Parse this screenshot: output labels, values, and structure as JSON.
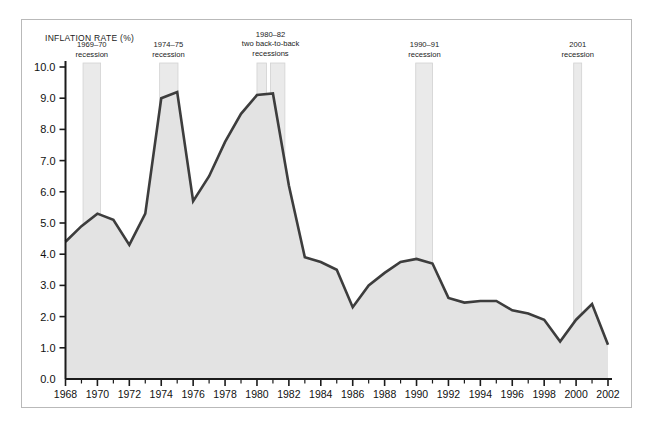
{
  "chart_data": {
    "type": "area",
    "title": "",
    "ylabel": "INFLATION RATE (%)",
    "xlabel": "",
    "xlim": [
      1968,
      2002
    ],
    "ylim": [
      0.0,
      10.0
    ],
    "grid": false,
    "legend": "none",
    "x_ticks": [
      1968,
      1970,
      1972,
      1974,
      1976,
      1978,
      1980,
      1982,
      1984,
      1986,
      1988,
      1990,
      1992,
      1994,
      1996,
      1998,
      2000,
      2002
    ],
    "x_tick_labels": [
      "1968",
      "1970",
      "1972",
      "1974",
      "1976",
      "1978",
      "1980",
      "1982",
      "1984",
      "1986",
      "1988",
      "1990",
      "1992",
      "1994",
      "1996",
      "1998",
      "2000",
      "2002"
    ],
    "x_minor_ticks": [
      1969,
      1971,
      1973,
      1975,
      1977,
      1979,
      1981,
      1983,
      1985,
      1987,
      1989,
      1991,
      1993,
      1995,
      1997,
      1999,
      2001
    ],
    "y_ticks": [
      0.0,
      1.0,
      2.0,
      3.0,
      4.0,
      5.0,
      6.0,
      7.0,
      8.0,
      9.0,
      10.0
    ],
    "y_tick_labels": [
      "0.0",
      "1.0",
      "2.0",
      "3.0",
      "4.0",
      "5.0",
      "6.0",
      "7.0",
      "8.0",
      "9.0",
      "10.0"
    ],
    "x": [
      1968,
      1969,
      1970,
      1971,
      1972,
      1973,
      1974,
      1975,
      1976,
      1977,
      1978,
      1979,
      1980,
      1981,
      1982,
      1983,
      1984,
      1985,
      1986,
      1987,
      1988,
      1989,
      1990,
      1991,
      1992,
      1993,
      1994,
      1995,
      1996,
      1997,
      1998,
      1999,
      2000,
      2001,
      2002
    ],
    "values": [
      4.4,
      4.9,
      5.3,
      5.1,
      4.3,
      5.3,
      9.0,
      9.2,
      5.7,
      6.5,
      7.6,
      8.5,
      9.1,
      9.15,
      6.2,
      3.9,
      3.75,
      3.5,
      2.3,
      3.0,
      3.4,
      3.75,
      3.85,
      3.7,
      2.6,
      2.45,
      2.5,
      2.5,
      2.2,
      2.1,
      1.9,
      1.2,
      1.9,
      2.4,
      1.1
    ],
    "series": [
      {
        "name": "Inflation rate",
        "values": [
          4.4,
          4.9,
          5.3,
          5.1,
          4.3,
          5.3,
          9.0,
          9.2,
          5.7,
          6.5,
          7.6,
          8.5,
          9.1,
          9.15,
          6.2,
          3.9,
          3.75,
          3.5,
          2.3,
          3.0,
          3.4,
          3.75,
          3.85,
          3.7,
          2.6,
          2.45,
          2.5,
          2.5,
          2.2,
          2.1,
          1.9,
          1.2,
          1.9,
          2.4,
          1.1
        ],
        "line_color": "#3d3d3d",
        "fill_color": "#e3e3e3"
      }
    ],
    "annotations": [
      {
        "id": "recession-1969-70",
        "lines": [
          "1969–70",
          "recession"
        ],
        "x_start": 1969.1,
        "x_end": 1970.2,
        "label_x": 1969.65
      },
      {
        "id": "recession-1974-75",
        "lines": [
          "1974–75",
          "recession"
        ],
        "x_start": 1973.9,
        "x_end": 1975.05,
        "label_x": 1974.45
      },
      {
        "id": "recession-1980-82",
        "lines": [
          "1980–82",
          "two back-to-back",
          "recessions"
        ],
        "x_start": 1980.0,
        "x_end": 1980.6,
        "x_start2": 1980.85,
        "x_end2": 1981.75,
        "label_x": 1980.85
      },
      {
        "id": "recession-1990-91",
        "lines": [
          "1990–91",
          "recession"
        ],
        "x_start": 1989.95,
        "x_end": 1991.0,
        "label_x": 1990.5
      },
      {
        "id": "recession-2001",
        "lines": [
          "2001",
          "recession"
        ],
        "x_start": 1999.85,
        "x_end": 2000.35,
        "label_x": 2000.1
      }
    ],
    "band_color": "#eaeaea",
    "band_edge_color": "#d2d2d2"
  },
  "colors": {
    "line": "#3d3d3d",
    "fill": "#e3e3e3",
    "band": "#eaeaea",
    "band_edge": "#d2d2d2",
    "axis": "#1b1b1b",
    "frame": "#b9b9b9",
    "background": "#ffffff"
  }
}
